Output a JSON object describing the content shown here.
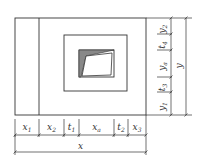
{
  "diagram": {
    "type": "dimensioned plan drawing",
    "line_color": "#333333",
    "outer_frame": {
      "x": 15,
      "y": 18,
      "w": 131,
      "h": 97
    },
    "divider_x": 39,
    "middle_frame": {
      "x": 64,
      "y": 35,
      "w": 63,
      "h": 56
    },
    "inner_frame": {
      "x": 79,
      "y": 50,
      "w": 35,
      "h": 27
    },
    "bottom_dimensions": [
      {
        "label": "x",
        "sub": "1",
        "from": 15,
        "to": 39
      },
      {
        "label": "x",
        "sub": "2",
        "from": 39,
        "to": 64
      },
      {
        "label": "t",
        "sub": "1",
        "from": 64,
        "to": 79
      },
      {
        "label": "x",
        "sub": "a",
        "from": 79,
        "to": 114
      },
      {
        "label": "t",
        "sub": "2",
        "from": 114,
        "to": 128
      },
      {
        "label": "x",
        "sub": "3",
        "from": 128,
        "to": 146
      }
    ],
    "bottom_total": {
      "label": "x",
      "from": 15,
      "to": 146
    },
    "right_dimensions": [
      {
        "label": "y",
        "sub": "2",
        "from": 18,
        "to": 34
      },
      {
        "label": "t",
        "sub": "4",
        "from": 34,
        "to": 50
      },
      {
        "label": "y",
        "sub": "a",
        "from": 50,
        "to": 77
      },
      {
        "label": "t",
        "sub": "3",
        "from": 77,
        "to": 92
      },
      {
        "label": "y",
        "sub": "1",
        "from": 92,
        "to": 115
      }
    ],
    "right_total": {
      "label": "y",
      "from": 18,
      "to": 115
    }
  }
}
